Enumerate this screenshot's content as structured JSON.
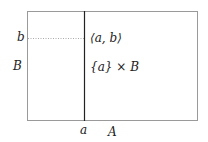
{
  "diagram": {
    "rectangle": {
      "x": 27,
      "y": 11,
      "width": 170,
      "height": 109,
      "stroke": "#9a9a9a"
    },
    "vertical_line": {
      "x": 84,
      "y1": 11,
      "y2": 120,
      "stroke": "#222222"
    },
    "dotted_line": {
      "x1": 27,
      "x2": 84,
      "y": 38,
      "stroke": "#aaaaaa"
    },
    "labels": {
      "b": "b",
      "B": "B",
      "point": "⟨a, b⟩",
      "fibre_set": "{a}",
      "fibre_times": "×",
      "fibre_B": "B",
      "a": "a",
      "A": "A"
    }
  }
}
